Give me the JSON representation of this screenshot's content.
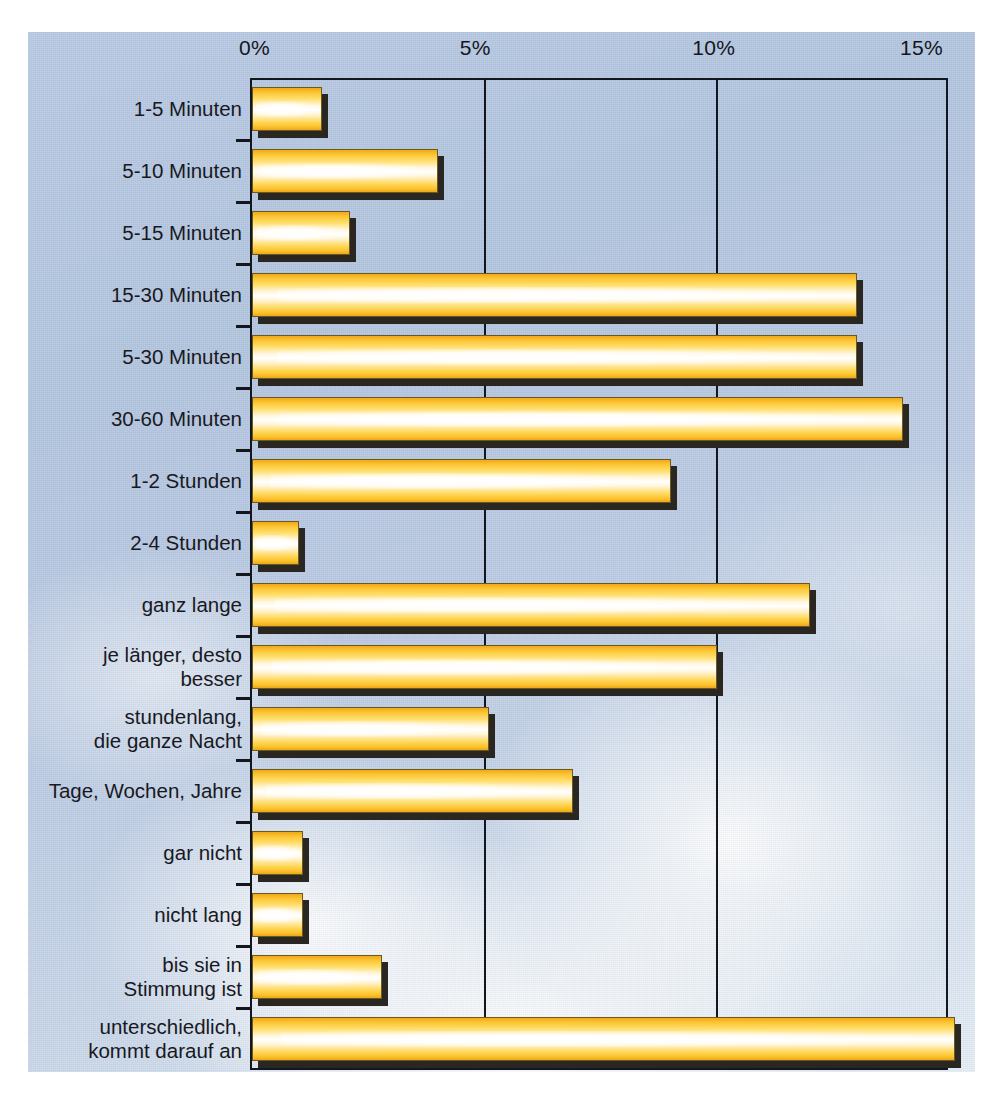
{
  "chart_data": {
    "type": "bar",
    "orientation": "horizontal",
    "title": "",
    "xlabel": "",
    "ylabel": "",
    "xlim": [
      0,
      15
    ],
    "grid": true,
    "legend": null,
    "axis_ticks": [
      "0%",
      "5%",
      "10%",
      "15%"
    ],
    "axis_tick_values": [
      0,
      5,
      10,
      15
    ],
    "categories": [
      "1-5 Minuten",
      "5-10 Minuten",
      "5-15 Minuten",
      "15-30 Minuten",
      "5-30 Minuten",
      "30-60 Minuten",
      "1-2 Stunden",
      "2-4 Stunden",
      "ganz lange",
      "je länger, desto\nbesser",
      "stundenlang,\ndie ganze Nacht",
      "Tage, Wochen, Jahre",
      "gar nicht",
      "nicht lang",
      "bis sie in\nStimmung ist",
      "unterschiedlich,\nkommt darauf an"
    ],
    "values": [
      1.5,
      4.0,
      2.1,
      13.0,
      13.0,
      14.0,
      9.0,
      1.0,
      12.0,
      10.0,
      5.1,
      6.9,
      1.1,
      1.1,
      2.8,
      15.1
    ],
    "unit": "%"
  },
  "colors": {
    "bar_edge": "#eda71c",
    "bar_core": "#ffffff",
    "bar_outline": "#6b5a20",
    "bar_shadow": "#2a2622",
    "axis": "#14161d",
    "background_sky_top": "#b4c6e0",
    "background_sky_bottom": "#e6eef6",
    "label_text": "#18191f"
  }
}
